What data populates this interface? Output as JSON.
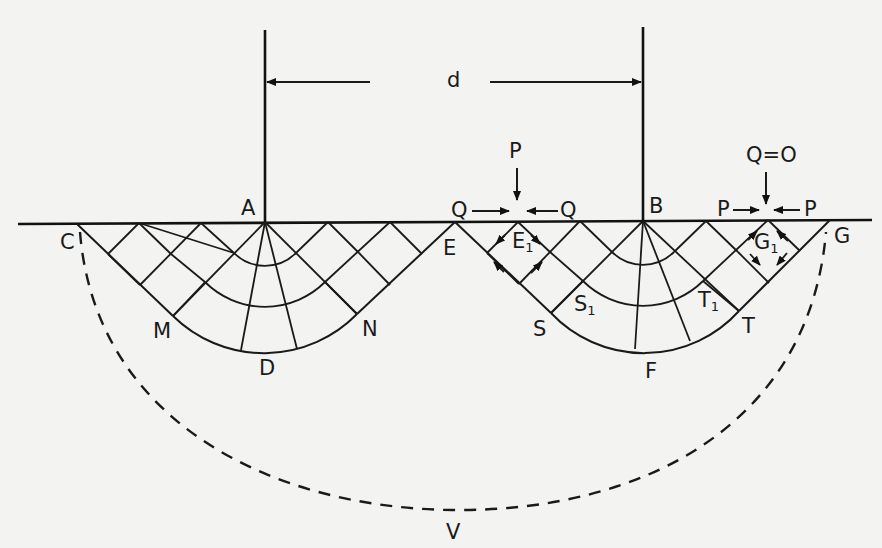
{
  "figure": {
    "dimension_label": "d",
    "points": {
      "A": "A",
      "B": "B",
      "C": "C",
      "D": "D",
      "E": "E",
      "F": "F",
      "G": "G",
      "M": "M",
      "N": "N",
      "S": "S",
      "T": "T",
      "V": "V"
    },
    "subscript_points": {
      "E1": {
        "base": "E",
        "sub": "1"
      },
      "S1": {
        "base": "S",
        "sub": "1"
      },
      "T1": {
        "base": "T",
        "sub": "1"
      },
      "G1": {
        "base": "G",
        "sub": "1"
      }
    },
    "forces": {
      "left_vertical": "P",
      "left_horizontal_left": "Q",
      "left_horizontal_right": "Q",
      "right_vertical": "Q=O",
      "right_horizontal_left": "P",
      "right_horizontal_right": "P"
    },
    "colors": {
      "ink": "#1a1a1a",
      "paper": "#f3f3f1"
    }
  }
}
